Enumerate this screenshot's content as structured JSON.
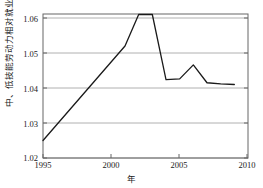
{
  "chart_data": {
    "type": "line",
    "title": "",
    "xlabel": "年",
    "ylabel": "中、低技能劳动力相对就业",
    "xlim": [
      1995,
      2010
    ],
    "ylim": [
      1.02,
      1.061
    ],
    "grid": true,
    "legend": "none",
    "xticks": [
      "1995",
      "2000",
      "2005",
      "2010"
    ],
    "xtick_values": [
      1995,
      2000,
      2005,
      2010
    ],
    "yticks": [
      "1.02",
      "1.03",
      "1.04",
      "1.05",
      "1.06"
    ],
    "ytick_values": [
      1.02,
      1.03,
      1.04,
      1.05,
      1.06
    ],
    "x": [
      1995,
      1996,
      1997,
      1998,
      1999,
      2000,
      2001,
      2002,
      2003,
      2004,
      2005,
      2006,
      2007,
      2008,
      2009
    ],
    "values": [
      1.025,
      1.0295,
      1.034,
      1.0385,
      1.043,
      1.0475,
      1.052,
      1.061,
      1.061,
      1.0424,
      1.0426,
      1.0466,
      1.0415,
      1.0412,
      1.041
    ],
    "series": [
      {
        "name": "中、低技能劳动力相对就业",
        "color": "#1a1a1a",
        "values": [
          1.025,
          1.0295,
          1.034,
          1.0385,
          1.043,
          1.0475,
          1.052,
          1.061,
          1.061,
          1.0424,
          1.0426,
          1.0466,
          1.0415,
          1.0412,
          1.041
        ]
      }
    ]
  },
  "axis": {
    "ytick_labels": [
      "1.06",
      "1.05",
      "1.04",
      "1.03",
      "1.02"
    ],
    "xtick_labels": [
      "1995",
      "2000",
      "2005",
      "2010"
    ],
    "x_axis_title": "年",
    "y_axis_title": "中、低技能劳动力相对就业"
  },
  "colors": {
    "line": "#1a1a1a",
    "grid": "#b0b0b0",
    "axis": "#555555",
    "background": "#ffffff"
  }
}
